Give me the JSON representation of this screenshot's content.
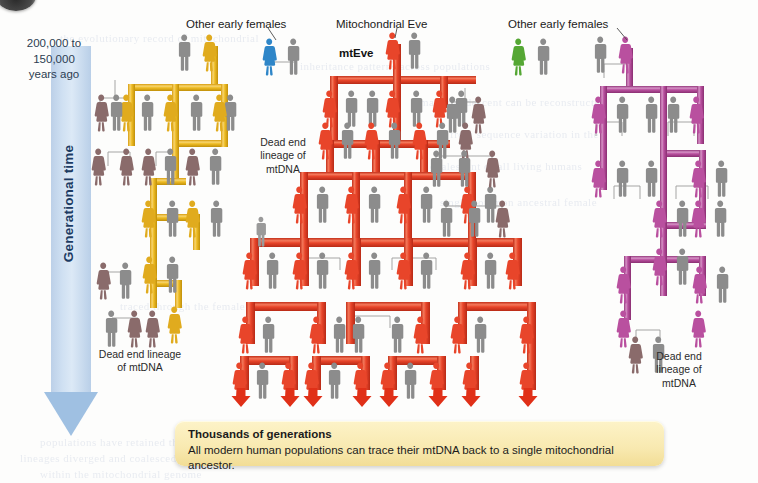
{
  "figure": {
    "domain": "diagram",
    "title_visible": false,
    "background_color": "#fdfdfc"
  },
  "time_axis": {
    "name": "generational-time-arrow",
    "top_note": "200,000  to\n150,000\nyears ago",
    "top_note_lines": [
      "200,000  to",
      "150,000",
      "years ago"
    ],
    "axis_label": "Generational time",
    "direction": "downward",
    "color": "#bcd0e8",
    "arrow_head_color": "#9fc0e2"
  },
  "annotations": [
    {
      "id": "other-early-females-left",
      "text": "Other early females",
      "x": 186,
      "y": 18,
      "leader_to_x": 268,
      "leader_to_y": 40
    },
    {
      "id": "mitochondrial-eve",
      "text": "Mitochondrial Eve",
      "x": 336,
      "y": 18,
      "leader_to_x": 392,
      "leader_to_y": 38
    },
    {
      "id": "mteve-tag",
      "text": "mtEve",
      "x": 339,
      "y": 48
    },
    {
      "id": "other-early-females-right",
      "text": "Other early females",
      "x": 508,
      "y": 18,
      "leader_to_x": 620,
      "leader_to_y": 40
    },
    {
      "id": "dead-end-center",
      "lines": [
        "Dead end",
        "lineage of",
        "mtDNA"
      ],
      "x": 260,
      "y": 138
    },
    {
      "id": "dead-end-left",
      "lines": [
        "Dead end lineage",
        "of mtDNA"
      ],
      "x": 86,
      "y": 350
    },
    {
      "id": "dead-end-right",
      "lines": [
        "Dead end",
        "lineage of",
        "mtDNA"
      ],
      "x": 648,
      "y": 352
    }
  ],
  "caption": {
    "title": "Thousands of generations",
    "body": "All modern human populations can trace their mtDNA back to a single mitochondrial ancestor.",
    "background_color": "#f8e9b0"
  },
  "lineages": [
    {
      "name": "mtEve lineage",
      "color": "#e8452a",
      "accent": "#f06a4a",
      "status": "surviving",
      "founder_label": "mtEve",
      "position": "center",
      "terminates_with_arrows": true,
      "arrow_count": 9
    },
    {
      "name": "left early-female lineage",
      "color": "#e8b422",
      "accent": "#f2cb55",
      "status": "dead end",
      "position": "left"
    },
    {
      "name": "right early-female lineage",
      "color": "#b9509f",
      "accent": "#cd7ab8",
      "status": "dead end",
      "position": "right"
    },
    {
      "name": "blue early female",
      "color": "#2f86c8",
      "status": "dead end",
      "position": "center-left-top"
    },
    {
      "name": "green early female",
      "color": "#55a734",
      "status": "dead end",
      "position": "center-right-top"
    }
  ],
  "legend_semantics": {
    "female_figure": "colored figure with skirt = female carrying that mtDNA lineage",
    "male_figure": "gray figure = male (does not transmit mtDNA)",
    "pipe": "thick colored pipe = mtDNA transmission path",
    "thin_line": "thin gray line = mating pair / non-transmitting link",
    "red_arrow": "red downward arrow = lineage continues to modern populations"
  },
  "bleed_text": [
    {
      "text": "the evolutionary record of mitochondrial",
      "x": 60,
      "y": 32
    },
    {
      "text": "inheritance patterns across populations",
      "x": 300,
      "y": 60
    },
    {
      "text": "maternal descent can be reconstructed",
      "x": 420,
      "y": 96
    },
    {
      "text": "from sequence variation in the",
      "x": 450,
      "y": 128
    },
    {
      "text": "coalescent of all living humans",
      "x": 430,
      "y": 160
    },
    {
      "text": "single common ancestral female",
      "x": 440,
      "y": 196
    },
    {
      "text": "traced through the female line",
      "x": 120,
      "y": 300
    },
    {
      "text": "populations have retained this",
      "x": 40,
      "y": 436
    },
    {
      "text": "lineages diverged and coalesced",
      "x": 20,
      "y": 452
    },
    {
      "text": "within the mitochondrial genome",
      "x": 40,
      "y": 468
    }
  ]
}
